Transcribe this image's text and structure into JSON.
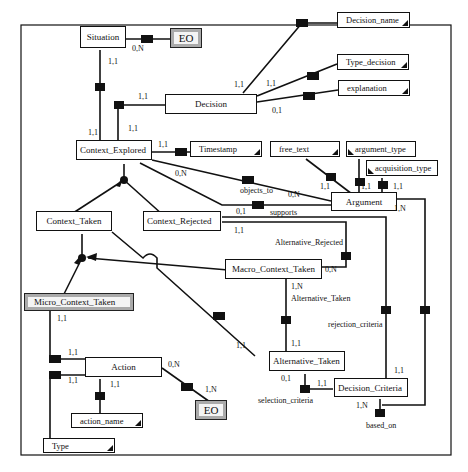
{
  "diagram": {
    "type": "entity-relationship",
    "entities": {
      "situation": "Situation",
      "decision": "Decision",
      "context_explored": "Context_Explored",
      "context_taken": "Context_Taken",
      "context_rejected": "Context_Rejected",
      "macro_context_taken": "Macro_Context_Taken",
      "micro_context_taken": "Micro_Context_Taken",
      "argument": "Argument",
      "action": "Action",
      "alternative_taken": "Alternative_Taken",
      "decision_criteria": "Decision_Criteria",
      "eo_top": "EO",
      "eo_bottom": "EO"
    },
    "attributes": {
      "decision_name": "Decision_name",
      "type_decision": "Type_decision",
      "explanation": "explanation",
      "timestamp": "Timestamp",
      "free_text": "free_text",
      "argument_type": "argument_type",
      "acquisition_type": "acquisition_type",
      "action_name": "action_name",
      "type": "Type"
    },
    "relationships": {
      "objects_to": "objects_to",
      "supports": "supports",
      "alternative_rejected": "Alternative_Rejected",
      "alternative_taken": "Alternative_Taken",
      "rejection_criteria": "rejection_criteria",
      "selection_criteria": "selection_criteria",
      "based_on": "based_on"
    },
    "cardinalities": {
      "situation_eo": "0,N",
      "situation_context": "1,1",
      "decision_context": "1,1",
      "context_decision": "1,1",
      "decision_name": "1,1",
      "type_decision": "1,1",
      "explanation": "0,1",
      "context_timestamp": "1,1",
      "context_objects_to": "0,N",
      "arg_objects_to": "0,N",
      "free_text": "1,1",
      "argument_type": "1,1",
      "acquisition_type": "1,1",
      "argument_based_on": "1,N",
      "rejected_supports": "0,1",
      "rejected_alt": "1,1",
      "macro_alt_rejected": "0,N",
      "macro_alt_taken": "1,N",
      "alt_taken_macro": "1,1",
      "alt_taken_ct": "1,1",
      "alt_selection": "0,1",
      "criteria_selection": "1,1",
      "criteria_rejection": "1,1",
      "criteria_based_on": "1,N",
      "micro_action": "1,1",
      "action_micro": "1,1",
      "action_type": "1,1",
      "action_name": "1,1",
      "action_eo": "0,N",
      "eo_action": "1,N"
    }
  }
}
